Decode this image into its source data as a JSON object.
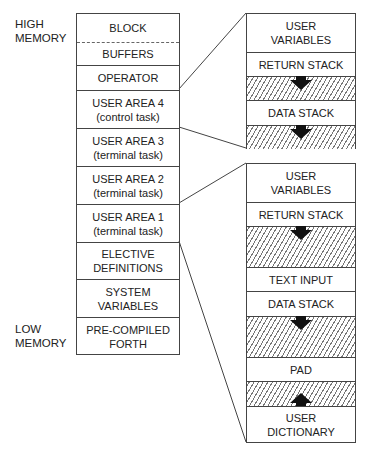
{
  "labels": {
    "high_memory": [
      "HIGH",
      "MEMORY"
    ],
    "low_memory": [
      "LOW",
      "MEMORY"
    ]
  },
  "memory_map": {
    "cells": [
      {
        "lines": [
          "BLOCK"
        ],
        "top": 0,
        "height": 28
      },
      {
        "lines": [
          "BUFFERS"
        ],
        "top": 28,
        "height": 23,
        "border": "dashed"
      },
      {
        "lines": [
          "OPERATOR"
        ],
        "top": 51,
        "height": 25
      },
      {
        "lines": [
          "USER AREA 4",
          "(control task)"
        ],
        "top": 76,
        "height": 38
      },
      {
        "lines": [
          "USER AREA 3",
          "(terminal task)"
        ],
        "top": 114,
        "height": 38
      },
      {
        "lines": [
          "USER AREA 2",
          "(terminal task)"
        ],
        "top": 152,
        "height": 38
      },
      {
        "lines": [
          "USER AREA 1",
          "(terminal task)"
        ],
        "top": 190,
        "height": 38
      },
      {
        "lines": [
          "ELECTIVE",
          "DEFINITIONS"
        ],
        "top": 228,
        "height": 37
      },
      {
        "lines": [
          "SYSTEM",
          "VARIABLES"
        ],
        "top": 265,
        "height": 38
      },
      {
        "lines": [
          "PRE-COMPILED",
          "FORTH"
        ],
        "top": 303,
        "height": 38
      }
    ]
  },
  "control_task_area": {
    "cells": [
      {
        "lines": [
          "USER",
          "VARIABLES"
        ],
        "top": 0,
        "height": 38
      },
      {
        "lines": [
          "RETURN STACK"
        ],
        "top": 38,
        "height": 24
      },
      {
        "lines": [],
        "top": 62,
        "height": 24,
        "hatched": true,
        "arrow": "down"
      },
      {
        "lines": [
          "DATA STACK"
        ],
        "top": 86,
        "height": 25
      },
      {
        "lines": [],
        "top": 111,
        "height": 24,
        "hatched": true,
        "arrow": "down"
      }
    ]
  },
  "terminal_task_area": {
    "cells": [
      {
        "lines": [
          "USER",
          "VARIABLES"
        ],
        "top": 0,
        "height": 38
      },
      {
        "lines": [
          "RETURN STACK"
        ],
        "top": 38,
        "height": 24
      },
      {
        "lines": [],
        "top": 62,
        "height": 41,
        "hatched": true,
        "arrow": "down"
      },
      {
        "lines": [
          "TEXT INPUT"
        ],
        "top": 103,
        "height": 24
      },
      {
        "lines": [
          "DATA STACK"
        ],
        "top": 127,
        "height": 25
      },
      {
        "lines": [],
        "top": 152,
        "height": 41,
        "hatched": true,
        "arrow": "down"
      },
      {
        "lines": [
          "PAD"
        ],
        "top": 193,
        "height": 24
      },
      {
        "lines": [],
        "top": 217,
        "height": 25,
        "hatched": true,
        "arrow": "up"
      },
      {
        "lines": [
          "USER",
          "DICTIONARY"
        ],
        "top": 242,
        "height": 37
      }
    ]
  },
  "colors": {
    "line": "#444444",
    "hatch": "#777777",
    "arrow": "#111111"
  }
}
